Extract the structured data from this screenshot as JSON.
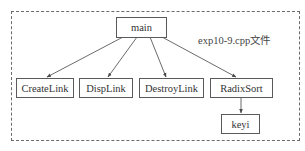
{
  "diagram": {
    "type": "call-graph",
    "container_label": "exp10-9.cpp文件",
    "nodes": {
      "main": "main",
      "create_link": "CreateLink",
      "disp_link": "DispLink",
      "destroy_link": "DestroyLink",
      "radix_sort": "RadixSort",
      "keyi": "keyi"
    },
    "edges": [
      {
        "from": "main",
        "to": "CreateLink"
      },
      {
        "from": "main",
        "to": "DispLink"
      },
      {
        "from": "main",
        "to": "DestroyLink"
      },
      {
        "from": "main",
        "to": "RadixSort"
      },
      {
        "from": "RadixSort",
        "to": "keyi"
      }
    ],
    "colors": {
      "line": "#5a5a5a",
      "border_dashed": "#6b6b6b",
      "text": "#333333",
      "background": "#ffffff"
    }
  }
}
